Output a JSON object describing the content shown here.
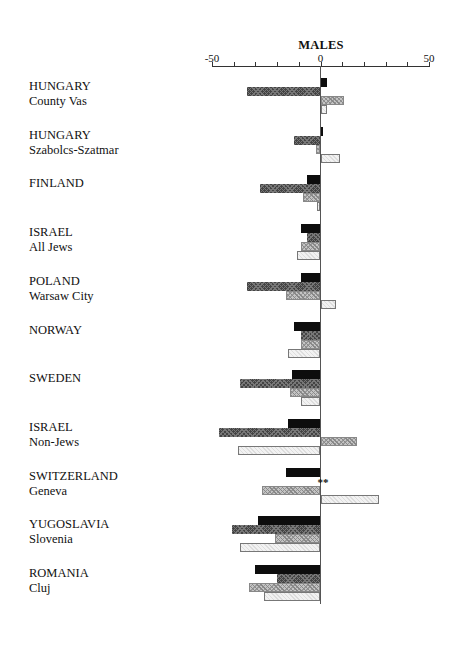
{
  "chart_data": {
    "type": "bar",
    "orientation": "horizontal",
    "title": "MALES",
    "xlabel": "",
    "ylabel": "",
    "xlim": [
      -50,
      50
    ],
    "x_ticks": [
      -50,
      -40,
      -30,
      -20,
      -10,
      0,
      10,
      20,
      30,
      40,
      50
    ],
    "x_tick_labels": [
      "-50",
      "0",
      "50"
    ],
    "legend": null,
    "series_styles": [
      "solid black",
      "dark crosshatch",
      "medium crosshatch",
      "light dotted"
    ],
    "categories": [
      {
        "country": "HUNGARY",
        "region": "County Vas"
      },
      {
        "country": "HUNGARY",
        "region": "Szabolcs-Szatmar"
      },
      {
        "country": "FINLAND",
        "region": ""
      },
      {
        "country": "ISRAEL",
        "region": "All Jews"
      },
      {
        "country": "POLAND",
        "region": "Warsaw City"
      },
      {
        "country": "NORWAY",
        "region": ""
      },
      {
        "country": "SWEDEN",
        "region": ""
      },
      {
        "country": "ISRAEL",
        "region": "Non-Jews"
      },
      {
        "country": "SWITZERLAND",
        "region": "Geneva"
      },
      {
        "country": "YUGOSLAVIA",
        "region": "Slovenia"
      },
      {
        "country": "ROMANIA",
        "region": "Cluj"
      }
    ],
    "series": [
      {
        "name": "series1 (black)",
        "values": [
          3,
          1,
          -6,
          -9,
          -9,
          -12,
          -13,
          -15,
          -16,
          -29,
          -30
        ]
      },
      {
        "name": "series2 (dark hatch)",
        "values": [
          -34,
          -12,
          -28,
          -6,
          -34,
          -9,
          -37,
          -47,
          null,
          -41,
          -20
        ]
      },
      {
        "name": "series3 (medium hatch)",
        "values": [
          11,
          -2,
          -8,
          -9,
          -16,
          -9,
          -14,
          17,
          -27,
          -21,
          -33
        ]
      },
      {
        "name": "series4 (light dotted)",
        "values": [
          3,
          9,
          -1.5,
          -11,
          7,
          -15,
          -9,
          -38,
          27,
          -37,
          -26
        ]
      }
    ],
    "annotations": [
      {
        "category": "SWITZERLAND Geneva",
        "series": 2,
        "text": "**"
      }
    ]
  }
}
